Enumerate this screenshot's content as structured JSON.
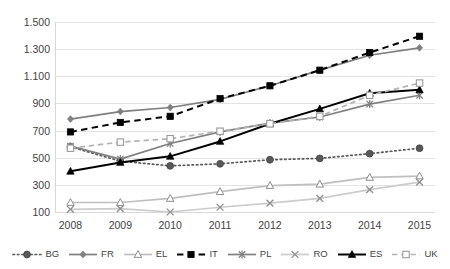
{
  "chart_data": {
    "type": "line",
    "title": "",
    "subtitle": "",
    "xlabel": "",
    "ylabel": "",
    "categories": [
      "2008",
      "2009",
      "2010",
      "2011",
      "2012",
      "2013",
      "2014",
      "2015"
    ],
    "x": [
      2008,
      2009,
      2010,
      2011,
      2012,
      2013,
      2014,
      2015
    ],
    "ylim": [
      100,
      1500
    ],
    "ytick_values": [
      100,
      300,
      500,
      700,
      900,
      1100,
      1300,
      1500
    ],
    "ytick_labels": [
      "100",
      "300",
      "500",
      "700",
      "900",
      "1.100",
      "1.300",
      "1.500"
    ],
    "grid": true,
    "legend_position": "bottom",
    "number_format": "european-dot-thousands",
    "series": [
      {
        "name": "BG",
        "label": "BG",
        "color": "#595959",
        "line_style": "dotted",
        "marker": "filled-circle",
        "values": [
          580,
          475,
          440,
          455,
          485,
          495,
          530,
          570
        ]
      },
      {
        "name": "FR",
        "label": "FR",
        "color": "#7f7f7f",
        "line_style": "solid",
        "marker": "diamond",
        "values": [
          785,
          840,
          870,
          930,
          1030,
          1145,
          1255,
          1310
        ]
      },
      {
        "name": "EL",
        "label": "EL",
        "color": "#bfbfbf",
        "line_style": "solid",
        "marker": "open-triangle",
        "values": [
          170,
          170,
          200,
          250,
          295,
          305,
          355,
          365
        ]
      },
      {
        "name": "IT",
        "label": "IT",
        "color": "#000000",
        "line_style": "dashed",
        "marker": "filled-square",
        "values": [
          690,
          760,
          805,
          935,
          1030,
          1145,
          1275,
          1395
        ]
      },
      {
        "name": "PL",
        "label": "PL",
        "color": "#808080",
        "line_style": "solid",
        "marker": "asterisk",
        "values": [
          585,
          490,
          605,
          690,
          755,
          800,
          895,
          960
        ]
      },
      {
        "name": "RO",
        "label": "RO",
        "color": "#cccccc",
        "line_style": "solid",
        "marker": "cross-x",
        "values": [
          120,
          125,
          100,
          135,
          165,
          200,
          265,
          320
        ]
      },
      {
        "name": "ES",
        "label": "ES",
        "color": "#000000",
        "line_style": "solid",
        "marker": "filled-triangle",
        "values": [
          400,
          465,
          510,
          620,
          750,
          860,
          975,
          1000
        ]
      },
      {
        "name": "UK",
        "label": "UK",
        "color": "#b3b3b3",
        "line_style": "dashed",
        "marker": "open-square",
        "values": [
          570,
          615,
          640,
          695,
          750,
          805,
          960,
          1050
        ]
      }
    ]
  },
  "legend": {
    "items": [
      {
        "label": "BG"
      },
      {
        "label": "FR"
      },
      {
        "label": "EL"
      },
      {
        "label": "IT"
      },
      {
        "label": "PL"
      },
      {
        "label": "RO"
      },
      {
        "label": "ES"
      },
      {
        "label": "UK"
      }
    ]
  }
}
